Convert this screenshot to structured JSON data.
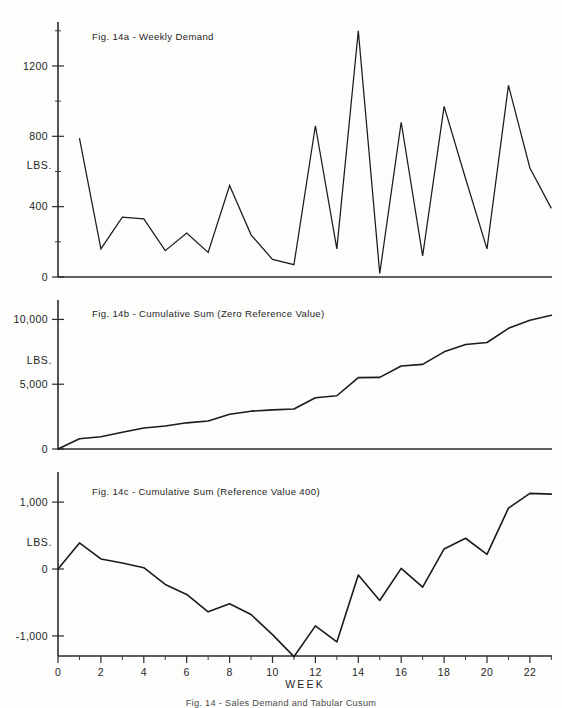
{
  "figure": {
    "caption": "Fig. 14 - Sales Demand and Tabular Cusum",
    "xaxis_name": "WEEK",
    "yaxis_unit": "LBS."
  },
  "panels": [
    {
      "id": "14a",
      "title": "Fig. 14a - Weekly Demand",
      "ytick_labels": [
        "0",
        "400",
        "800",
        "1200"
      ]
    },
    {
      "id": "14b",
      "title": "Fig. 14b - Cumulative Sum (Zero Reference Value)",
      "ytick_labels": [
        "0",
        "5,000",
        "10,000"
      ]
    },
    {
      "id": "14c",
      "title": "Fig. 14c - Cumulative Sum (Reference Value 400)",
      "ytick_labels": [
        "-1,000",
        "0",
        "1,000"
      ]
    }
  ],
  "xtick_labels": [
    "0",
    "2",
    "4",
    "6",
    "8",
    "10",
    "12",
    "14",
    "16",
    "18",
    "20",
    "22"
  ],
  "chart_data": [
    {
      "type": "line",
      "panel": "14a",
      "title": "Fig. 14a - Weekly Demand",
      "xlabel": "WEEK",
      "ylabel": "LBS.",
      "xlim": [
        0,
        23.5
      ],
      "ylim": [
        0,
        1450
      ],
      "yticks": [
        0,
        400,
        800,
        1200
      ],
      "xticks": [
        0,
        2,
        4,
        6,
        8,
        10,
        12,
        14,
        16,
        18,
        20,
        22
      ],
      "grid": false,
      "legend": "none",
      "x": [
        1,
        2,
        3,
        4,
        5,
        6,
        7,
        8,
        9,
        10,
        11,
        12,
        13,
        14,
        15,
        16,
        17,
        18,
        19,
        20,
        21,
        22,
        23
      ],
      "values": [
        790,
        160,
        340,
        330,
        150,
        250,
        140,
        520,
        240,
        100,
        70,
        860,
        160,
        1400,
        20,
        880,
        120,
        970,
        560,
        160,
        1090,
        620,
        390
      ],
      "categories": [
        "1",
        "2",
        "3",
        "4",
        "5",
        "6",
        "7",
        "8",
        "9",
        "10",
        "11",
        "12",
        "13",
        "14",
        "15",
        "16",
        "17",
        "18",
        "19",
        "20",
        "21",
        "22",
        "23"
      ]
    },
    {
      "type": "line",
      "panel": "14b",
      "title": "Fig. 14b - Cumulative Sum (Zero Reference Value)",
      "xlabel": "WEEK",
      "ylabel": "LBS.",
      "xlim": [
        0,
        23.5
      ],
      "ylim": [
        0,
        11500
      ],
      "yticks": [
        0,
        5000,
        10000
      ],
      "xticks": [
        0,
        2,
        4,
        6,
        8,
        10,
        12,
        14,
        16,
        18,
        20,
        22
      ],
      "grid": false,
      "legend": "none",
      "x": [
        0,
        1,
        2,
        3,
        4,
        5,
        6,
        7,
        8,
        9,
        10,
        11,
        12,
        13,
        14,
        15,
        16,
        17,
        18,
        19,
        20,
        21,
        22,
        23
      ],
      "values": [
        0,
        790,
        950,
        1290,
        1620,
        1770,
        2020,
        2160,
        2680,
        2920,
        3020,
        3090,
        3950,
        4110,
        5510,
        5530,
        6410,
        6530,
        7500,
        8060,
        8220,
        9310,
        9930,
        10320
      ],
      "categories": [
        "0",
        "1",
        "2",
        "3",
        "4",
        "5",
        "6",
        "7",
        "8",
        "9",
        "10",
        "11",
        "12",
        "13",
        "14",
        "15",
        "16",
        "17",
        "18",
        "19",
        "20",
        "21",
        "22",
        "23"
      ]
    },
    {
      "type": "line",
      "panel": "14c",
      "title": "Fig. 14c - Cumulative Sum (Reference Value 400)",
      "xlabel": "WEEK",
      "ylabel": "LBS.",
      "xlim": [
        0,
        23.5
      ],
      "ylim": [
        -1300,
        1450
      ],
      "yticks": [
        -1000,
        0,
        1000
      ],
      "xticks": [
        0,
        2,
        4,
        6,
        8,
        10,
        12,
        14,
        16,
        18,
        20,
        22
      ],
      "grid": false,
      "legend": "none",
      "reference_value": 400,
      "x": [
        0,
        1,
        2,
        3,
        4,
        5,
        6,
        7,
        8,
        9,
        10,
        11,
        12,
        13,
        14,
        15,
        16,
        17,
        18,
        19,
        20,
        21,
        22,
        23
      ],
      "values": [
        0,
        390,
        150,
        90,
        20,
        -230,
        -380,
        -640,
        -520,
        -680,
        -980,
        -1310,
        -850,
        -1090,
        -90,
        -470,
        10,
        -270,
        300,
        460,
        220,
        910,
        1130,
        1120
      ],
      "categories": [
        "0",
        "1",
        "2",
        "3",
        "4",
        "5",
        "6",
        "7",
        "8",
        "9",
        "10",
        "11",
        "12",
        "13",
        "14",
        "15",
        "16",
        "17",
        "18",
        "19",
        "20",
        "21",
        "22",
        "23"
      ]
    }
  ]
}
